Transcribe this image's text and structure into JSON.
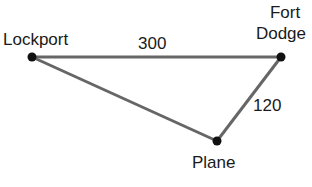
{
  "diagram": {
    "points": [
      {
        "id": "lockport",
        "label": "Lockport",
        "x": 32,
        "y": 57
      },
      {
        "id": "fort-dodge",
        "label_line1": "Fort",
        "label_line2": "Dodge",
        "x": 281,
        "y": 57
      },
      {
        "id": "plane",
        "label": "Plane",
        "x": 217,
        "y": 141
      }
    ],
    "edges": [
      {
        "from": "lockport",
        "to": "fort-dodge",
        "label": "300"
      },
      {
        "from": "fort-dodge",
        "to": "plane",
        "label": "120"
      },
      {
        "from": "lockport",
        "to": "plane",
        "label": ""
      }
    ],
    "colors": {
      "line": "#666666",
      "point": "#111111",
      "text": "#1a1a1a"
    }
  }
}
